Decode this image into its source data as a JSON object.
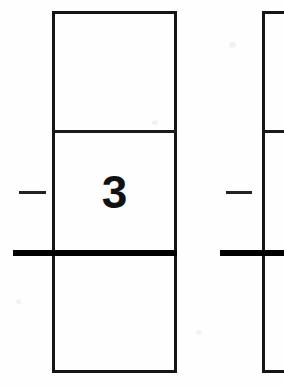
{
  "page": {
    "background_color": "#fefefe",
    "ink_color": "#111111",
    "width": 284,
    "height": 386
  },
  "problems": [
    {
      "id": "problem-left",
      "operator_symbol": "–",
      "operator_name": "minus",
      "answer_rule_visible": true,
      "cells": [
        {
          "position": "top",
          "value": ""
        },
        {
          "position": "middle",
          "value": "3"
        },
        {
          "position": "bottom",
          "value": ""
        }
      ],
      "box": {
        "x": 52,
        "y": 11,
        "width": 125,
        "height": 362
      },
      "dividers_y": [
        131,
        253
      ],
      "rule": {
        "x": 13,
        "y": 250,
        "width": 164,
        "height": 6
      },
      "minus": {
        "x": 19,
        "y": 191,
        "width": 27,
        "height": 3
      },
      "digit": {
        "x": 98,
        "y": 172,
        "size": 46
      }
    },
    {
      "id": "problem-right",
      "operator_symbol": "–",
      "operator_name": "minus",
      "answer_rule_visible": true,
      "cells": [
        {
          "position": "top",
          "value": ""
        },
        {
          "position": "middle",
          "value": ""
        },
        {
          "position": "bottom",
          "value": ""
        }
      ],
      "box": {
        "x": 262,
        "y": 11,
        "width": 125,
        "height": 362
      },
      "dividers_y": [
        131,
        253
      ],
      "rule": {
        "x": 220,
        "y": 250,
        "width": 64,
        "height": 6
      },
      "minus": {
        "x": 226,
        "y": 191,
        "width": 26,
        "height": 3
      },
      "digit": {
        "x": 308,
        "y": 172,
        "size": 46
      }
    }
  ],
  "colors": {
    "ink": "#111111",
    "rule": "#000000",
    "border": "#151515",
    "paper": "#fefefe"
  }
}
